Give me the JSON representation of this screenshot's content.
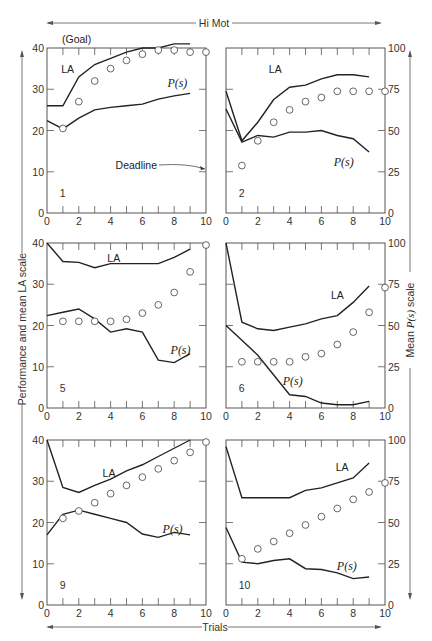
{
  "header": {
    "label": "Hi Mot"
  },
  "footer": {
    "label": "Trials"
  },
  "left_axis_label": "Performance and mean LA scale",
  "right_axis_label_prefix": "Mean ",
  "right_axis_label_ps": "P(s)",
  "right_axis_label_suffix": " scale",
  "chart_data": {
    "type": "line",
    "title": "Hi Mot",
    "xlabel": "Trials",
    "ylabel_left": "Performance and mean LA scale",
    "ylabel_right": "Mean P(s) scale",
    "left_ylim": [
      0,
      40
    ],
    "right_ylim": [
      0,
      100
    ],
    "xlim": [
      0,
      10
    ],
    "left_yticks": [
      0,
      10,
      20,
      30,
      40
    ],
    "right_yticks": [
      0,
      25,
      50,
      75,
      100
    ],
    "xticks": [
      0,
      2,
      4,
      6,
      8,
      10
    ],
    "legend_position": "inline labels",
    "grid": false,
    "series_descriptions": {
      "LA": "mean LA (left scale, solid line)",
      "P(s)": "mean P(s) (right scale, solid line)",
      "performance": "performance (left scale, open circles)"
    },
    "panels": [
      {
        "id": "1",
        "col": 0,
        "row": 0,
        "annotations": [
          {
            "text": "(Goal)",
            "pos": "top-left"
          },
          {
            "text": "Deadline",
            "pos": "right",
            "arrow": true
          }
        ],
        "la_label_pos": [
          1.3,
          34
        ],
        "ps_label_pos": [
          8.2,
          30.5
        ],
        "LA": {
          "x": [
            0,
            1,
            2,
            3,
            4,
            5,
            6,
            7,
            8,
            9
          ],
          "y": [
            26,
            26,
            33,
            36,
            37.5,
            39,
            40,
            40,
            41,
            41
          ]
        },
        "P_s": {
          "x": [
            0,
            1,
            2,
            3,
            4,
            5,
            6,
            7,
            8,
            9
          ],
          "y": [
            56,
            51,
            57.5,
            62.5,
            64,
            65,
            66,
            69,
            71,
            72.5
          ]
        },
        "performance": {
          "x": [
            1,
            2,
            3,
            4,
            5,
            6,
            7,
            8,
            9,
            10
          ],
          "y": [
            20.5,
            27,
            32,
            35,
            37,
            38.5,
            39.5,
            39.5,
            39,
            39
          ]
        }
      },
      {
        "id": "2",
        "col": 1,
        "row": 0,
        "la_label_pos": [
          3.1,
          34
        ],
        "ps_label_pos": [
          7.4,
          11.5
        ],
        "LA": {
          "x": [
            0,
            1,
            2,
            3,
            4,
            5,
            6,
            7,
            8,
            9
          ],
          "y": [
            29.5,
            17.5,
            22,
            27.5,
            30.5,
            31,
            32.5,
            33.5,
            33.5,
            33
          ]
        },
        "P_s": {
          "x": [
            0,
            1,
            2,
            3,
            4,
            5,
            6,
            7,
            8,
            9
          ],
          "y": [
            63,
            43,
            47,
            46,
            49,
            49,
            50,
            47,
            45,
            37
          ]
        },
        "performance": {
          "x": [
            1,
            2,
            3,
            4,
            5,
            6,
            7,
            8,
            9,
            10
          ],
          "y": [
            11.5,
            17.5,
            22,
            25,
            27,
            28,
            29.5,
            29.5,
            29.5,
            29.5
          ]
        }
      },
      {
        "id": "5",
        "col": 0,
        "row": 1,
        "la_label_pos": [
          4.2,
          35.5
        ],
        "ps_label_pos": [
          8.4,
          13
        ],
        "LA": {
          "x": [
            0,
            1,
            2,
            3,
            4,
            5,
            6,
            7,
            8,
            9
          ],
          "y": [
            40,
            35.5,
            35.3,
            34,
            35,
            35,
            35,
            35,
            36.5,
            38.5
          ]
        },
        "P_s": {
          "x": [
            0,
            1,
            2,
            3,
            4,
            5,
            6,
            7,
            8,
            9
          ],
          "y": [
            56,
            58,
            60,
            54,
            46,
            48,
            46,
            29,
            27.5,
            33
          ]
        },
        "performance": {
          "x": [
            1,
            2,
            3,
            4,
            5,
            6,
            7,
            8,
            9,
            10
          ],
          "y": [
            21,
            21,
            21,
            21,
            21.5,
            23,
            25,
            28,
            33,
            39.5
          ]
        }
      },
      {
        "id": "6",
        "col": 1,
        "row": 1,
        "la_label_pos": [
          7.0,
          26.5
        ],
        "ps_label_pos": [
          4.2,
          5.5
        ],
        "LA": {
          "x": [
            0,
            1,
            2,
            3,
            4,
            5,
            6,
            7,
            8,
            9
          ],
          "y": [
            40,
            20.8,
            19.2,
            18.8,
            19.6,
            20.4,
            21.6,
            22.4,
            25.6,
            29.6
          ]
        },
        "P_s": {
          "x": [
            0,
            1,
            2,
            3,
            4,
            5,
            6,
            7,
            8,
            9
          ],
          "y": [
            50,
            41,
            32,
            20,
            8,
            7,
            3,
            2,
            2,
            4
          ]
        },
        "performance": {
          "x": [
            1,
            2,
            3,
            4,
            5,
            6,
            7,
            8,
            9,
            10
          ],
          "y": [
            11.2,
            11.2,
            11.2,
            11.2,
            12.4,
            13.2,
            15.4,
            18.4,
            23.2,
            29.2
          ]
        }
      },
      {
        "id": "9",
        "col": 0,
        "row": 2,
        "la_label_pos": [
          3.9,
          31
        ],
        "ps_label_pos": [
          7.9,
          17.5
        ],
        "LA": {
          "x": [
            0,
            1,
            2,
            3,
            4,
            5,
            6,
            7,
            8,
            9
          ],
          "y": [
            40,
            28.5,
            27.3,
            29,
            30.5,
            32.5,
            34,
            36,
            38,
            40
          ]
        },
        "P_s": {
          "x": [
            0,
            1,
            2,
            3,
            4,
            5,
            6,
            7,
            8,
            9
          ],
          "y": [
            42.5,
            55,
            57.5,
            55,
            52.5,
            50,
            43,
            41,
            44,
            42.5
          ]
        },
        "performance": {
          "x": [
            1,
            2,
            3,
            4,
            5,
            6,
            7,
            8,
            9,
            10
          ],
          "y": [
            21,
            22.8,
            24.8,
            27,
            29,
            31,
            33,
            35,
            37,
            39.5
          ]
        }
      },
      {
        "id": "10",
        "col": 1,
        "row": 2,
        "la_label_pos": [
          7.3,
          32.5
        ],
        "ps_label_pos": [
          7.6,
          8.5
        ],
        "LA": {
          "x": [
            0,
            1,
            2,
            3,
            4,
            5,
            6,
            7,
            8,
            9
          ],
          "y": [
            38.4,
            26,
            26,
            26,
            26,
            27.8,
            28.4,
            29.6,
            30.8,
            34.4
          ]
        },
        "P_s": {
          "x": [
            0,
            1,
            2,
            3,
            4,
            5,
            6,
            7,
            8,
            9
          ],
          "y": [
            47,
            26,
            25,
            27,
            28,
            22,
            21.5,
            19.5,
            16,
            17
          ]
        },
        "performance": {
          "x": [
            1,
            2,
            3,
            4,
            5,
            6,
            7,
            8,
            9,
            10
          ],
          "y": [
            11.2,
            13.6,
            15.4,
            17.4,
            19.4,
            21.4,
            23.4,
            25.6,
            27.4,
            29.6
          ]
        }
      }
    ]
  },
  "labels": {
    "la": "LA",
    "ps": "P(s)",
    "goal": "(Goal)",
    "deadline": "Deadline"
  }
}
